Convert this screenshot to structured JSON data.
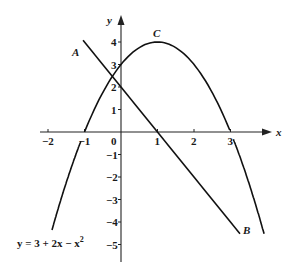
{
  "diagram": {
    "type": "coordinate-graph",
    "axes": {
      "x_label": "x",
      "y_label": "y",
      "x_ticks": [
        {
          "value": -2,
          "label": "−2"
        },
        {
          "value": -1,
          "label": "−1"
        },
        {
          "value": 0,
          "label": "0"
        },
        {
          "value": 1,
          "label": "1"
        },
        {
          "value": 2,
          "label": "2"
        },
        {
          "value": 3,
          "label": "3"
        }
      ],
      "y_ticks": [
        {
          "value": 4,
          "label": "4"
        },
        {
          "value": 3,
          "label": "3"
        },
        {
          "value": 2,
          "label": "2"
        },
        {
          "value": 1,
          "label": "1"
        },
        {
          "value": -1,
          "label": "−1"
        },
        {
          "value": -2,
          "label": "−2"
        },
        {
          "value": -3,
          "label": "−3"
        },
        {
          "value": -4,
          "label": "−4"
        },
        {
          "value": -5,
          "label": "−5"
        }
      ],
      "xlim": [
        -2.2,
        4.1
      ],
      "ylim": [
        -5.8,
        5.1
      ]
    },
    "curves": [
      {
        "name": "C",
        "label": "C",
        "equation_label": "y = 3 + 2x − x²",
        "kind": "parabola",
        "a": -1,
        "b": 2,
        "c": 3,
        "x_range": [
          -1.89,
          3.92
        ]
      },
      {
        "name": "AB",
        "label_start": "A",
        "label_end": "B",
        "kind": "line",
        "slope": -2,
        "intercept": 2,
        "x_range": [
          -1.04,
          3.26
        ]
      }
    ],
    "colors": {
      "ink": "#111111",
      "background": "#ffffff"
    }
  }
}
